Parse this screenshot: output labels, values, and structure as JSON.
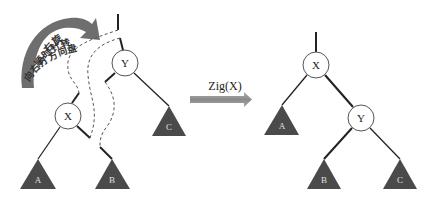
{
  "rotation_note": {
    "line1": "右旋",
    "line2": "顺时针转",
    "line3": "向右打方向盘"
  },
  "operation": {
    "label": "Zig(X)"
  },
  "before_tree": {
    "root": "Y",
    "left_child": "X",
    "right_subtree": "C",
    "x_left_subtree": "A",
    "x_right_subtree": "B"
  },
  "after_tree": {
    "root": "X",
    "left_subtree": "A",
    "right_child": "Y",
    "y_left_subtree": "B",
    "y_right_subtree": "C"
  },
  "colors": {
    "subtree_fill": "#4a4a4a",
    "arrow_fill": "#8c8c8c",
    "curved_arrow_fill": "#6e6e6e"
  }
}
